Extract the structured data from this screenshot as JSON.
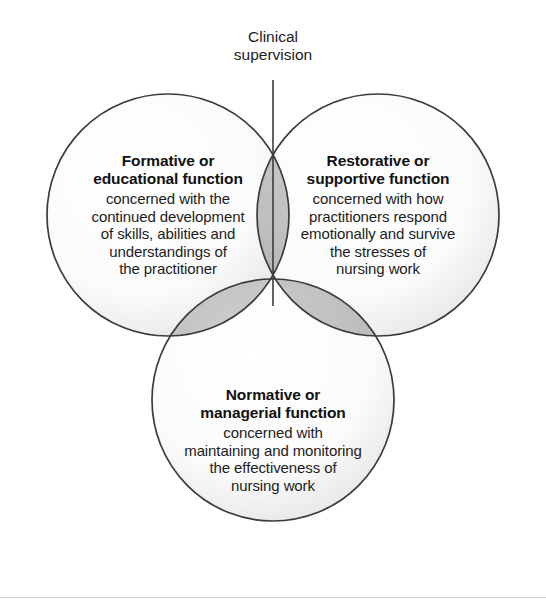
{
  "diagram": {
    "kind": "venn-3-circle",
    "caption": {
      "text": "Clinical\nsupervision"
    },
    "colors": {
      "circle_stroke": "#3b3b3b",
      "circle_fill_light": "#ffffff",
      "circle_fill_edge": "#e6e6e6",
      "overlap_fill": "#b9b9b9",
      "triple_overlap_fill": "#ffffff",
      "text": "#1a1a1a",
      "connector_line": "#3b3b3b",
      "footer_rule": "#d2d2d2",
      "background": "#ffffff"
    },
    "circles": [
      {
        "id": "formative",
        "title": "Formative or\neducational function",
        "body": "concerned with the\ncontinued development\nof skills, abilities and\nunderstandings of\nthe practitioner",
        "cx": 168,
        "cy": 215,
        "r": 121
      },
      {
        "id": "restorative",
        "title": "Restorative or\nsupportive function",
        "body": "concerned with how\npractitioners respond\nemotionally and survive\nthe stresses of\nnursing work",
        "cx": 378,
        "cy": 215,
        "r": 121
      },
      {
        "id": "normative",
        "title": "Normative or\nmanagerial function",
        "body": "concerned with\nmaintaining and monitoring\nthe effectiveness of\nnursing work",
        "cx": 273,
        "cy": 400,
        "r": 121
      }
    ],
    "connector": {
      "x": 273,
      "y_start": 80,
      "y_end": 306
    }
  }
}
